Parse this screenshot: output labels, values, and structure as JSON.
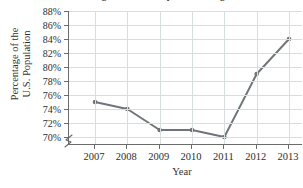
{
  "chart_data": {
    "type": "line",
    "title": "Percentage of the U.S. Population Using the Internet",
    "xlabel": "Year",
    "ylabel_line1": "Percentage of the",
    "ylabel_line2": "U.S. Population",
    "categories": [
      "2007",
      "2008",
      "2009",
      "2010",
      "2011",
      "2012",
      "2013"
    ],
    "values": [
      75,
      74,
      71,
      71,
      70,
      79,
      84
    ],
    "ytick_labels": [
      "70%",
      "72%",
      "74%",
      "76%",
      "78%",
      "80%",
      "82%",
      "84%",
      "86%",
      "88%"
    ],
    "ytick_values": [
      70,
      72,
      74,
      76,
      78,
      80,
      82,
      84,
      86,
      88
    ],
    "ylim": [
      69,
      88
    ],
    "grid": true,
    "legend": "none",
    "series_color": "#6e7478",
    "grid_color": "#d8dde0",
    "axis_color": "#6b6b6b"
  }
}
